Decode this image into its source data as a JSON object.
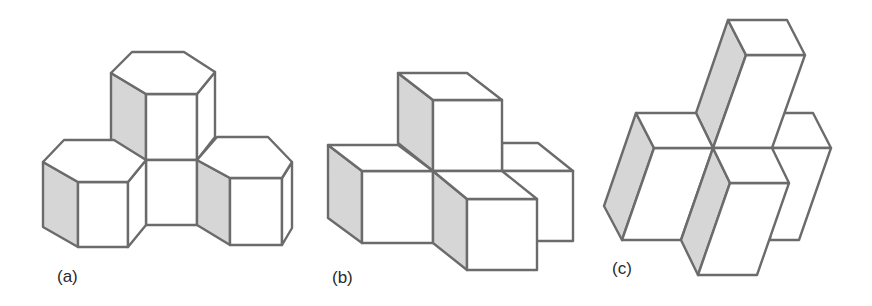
{
  "figure": {
    "panels": [
      {
        "id": "a",
        "label": "(a)",
        "description": "Three hexagonal prisms arranged around a central square-faced prism"
      },
      {
        "id": "b",
        "label": "(b)",
        "description": "Four cubes stacked around a shared vertex"
      },
      {
        "id": "c",
        "label": "(c)",
        "description": "Four sheared rectangular prisms around a shared vertex"
      }
    ]
  },
  "colors": {
    "edge": "#6b6b6b",
    "shaded_face": "#d6d6d6",
    "face": "#ffffff",
    "background": "#ffffff"
  }
}
